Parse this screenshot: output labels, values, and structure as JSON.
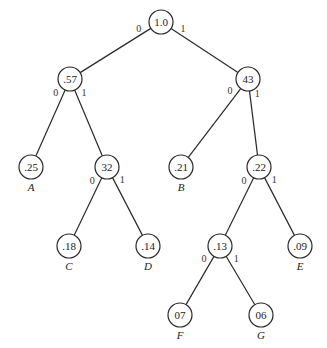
{
  "diagram": {
    "type": "huffman-tree",
    "nodes": [
      {
        "id": "root",
        "value": "1.0",
        "x": 161,
        "y": 22
      },
      {
        "id": "n57",
        "value": ".57",
        "x": 70,
        "y": 79
      },
      {
        "id": "n43",
        "value": "43",
        "x": 248,
        "y": 79
      },
      {
        "id": "n25",
        "value": ".25",
        "x": 31,
        "y": 167,
        "label": "A"
      },
      {
        "id": "n32",
        "value": "32",
        "x": 107,
        "y": 167
      },
      {
        "id": "n21",
        "value": ".21",
        "x": 181,
        "y": 167,
        "label": "B"
      },
      {
        "id": "n22",
        "value": ".22",
        "x": 259,
        "y": 167
      },
      {
        "id": "n18",
        "value": ".18",
        "x": 69,
        "y": 246,
        "label": "C"
      },
      {
        "id": "n14",
        "value": ".14",
        "x": 148,
        "y": 246,
        "label": "D"
      },
      {
        "id": "n13",
        "value": ".13",
        "x": 220,
        "y": 246
      },
      {
        "id": "n09",
        "value": ".09",
        "x": 300,
        "y": 246,
        "label": "E"
      },
      {
        "id": "n07",
        "value": "07",
        "x": 180,
        "y": 315,
        "label": "F"
      },
      {
        "id": "n06",
        "value": "06",
        "x": 261,
        "y": 315,
        "label": "G"
      }
    ],
    "edges": [
      {
        "from": "root",
        "to": "n57",
        "bit": "0"
      },
      {
        "from": "root",
        "to": "n43",
        "bit": "1"
      },
      {
        "from": "n57",
        "to": "n25",
        "bit": "0"
      },
      {
        "from": "n57",
        "to": "n32",
        "bit": "1"
      },
      {
        "from": "n43",
        "to": "n21",
        "bit": "0"
      },
      {
        "from": "n43",
        "to": "n22",
        "bit": "1"
      },
      {
        "from": "n32",
        "to": "n18",
        "bit": "0"
      },
      {
        "from": "n32",
        "to": "n14",
        "bit": "1"
      },
      {
        "from": "n22",
        "to": "n13",
        "bit": "0"
      },
      {
        "from": "n22",
        "to": "n09",
        "bit": "1"
      },
      {
        "from": "n13",
        "to": "n07",
        "bit": "0"
      },
      {
        "from": "n13",
        "to": "n06",
        "bit": "1"
      }
    ],
    "node_radius": 12
  }
}
